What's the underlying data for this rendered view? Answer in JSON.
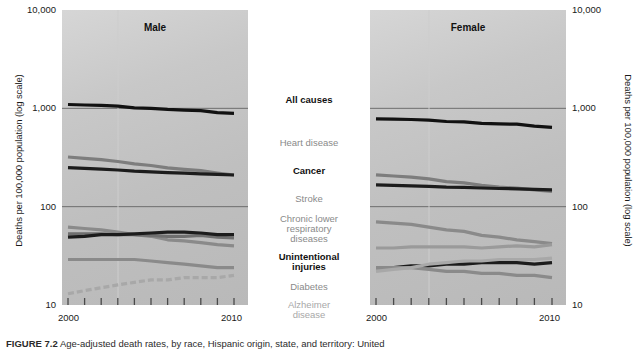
{
  "figure": {
    "caption_label": "FIGURE 7.2",
    "caption_text": "Age-adjusted death rates, by race, Hispanic origin, state, and territory: United"
  },
  "axes": {
    "y_title": "Deaths per 100,000 population (log scale)",
    "y_ticks": [
      "10,000",
      "1,000",
      "100",
      "10"
    ],
    "x_ticks": [
      "2000",
      "2010"
    ],
    "x_start_label": "2000",
    "x_end_label": "2010",
    "grid": "log",
    "ylim": [
      10,
      10000
    ]
  },
  "panels": [
    {
      "title": "Male"
    },
    {
      "title": "Female"
    }
  ],
  "legend": [
    {
      "label": "All causes",
      "style": "bold",
      "color": "#111111"
    },
    {
      "label": "Heart disease",
      "style": "gray",
      "color": "#8a8a8a"
    },
    {
      "label": "Cancer",
      "style": "bold",
      "color": "#111111"
    },
    {
      "label": "Stroke",
      "style": "gray",
      "color": "#8a8a8a"
    },
    {
      "label": "Chronic lower respiratory diseases",
      "style": "gray",
      "color": "#8a8a8a"
    },
    {
      "label": "Unintentional injuries",
      "style": "bold",
      "color": "#111111"
    },
    {
      "label": "Diabetes",
      "style": "gray",
      "color": "#8a8a8a"
    },
    {
      "label": "Alzheimer disease",
      "style": "light",
      "color": "#a8a8a8"
    }
  ],
  "chart_data": {
    "type": "line",
    "title": "Age-adjusted death rates, by race, Hispanic origin, state, and territory: United",
    "xlabel": "",
    "ylabel": "Deaths per 100,000 population (log scale)",
    "yscale": "log",
    "ylim": [
      10,
      10000
    ],
    "x": [
      2000,
      2001,
      2002,
      2003,
      2004,
      2005,
      2006,
      2007,
      2008,
      2009,
      2010
    ],
    "panels": [
      {
        "name": "Male",
        "series": [
          {
            "name": "All causes",
            "color": "#111111",
            "dash": false,
            "values": [
              1095,
              1080,
              1070,
              1050,
              1010,
              1000,
              975,
              960,
              945,
              905,
              890
            ]
          },
          {
            "name": "Heart disease",
            "color": "#7d7d7d",
            "dash": false,
            "values": [
              320,
              310,
              300,
              288,
              272,
              262,
              248,
              240,
              232,
              220,
              210
            ]
          },
          {
            "name": "Cancer",
            "color": "#1c1c1c",
            "dash": false,
            "values": [
              249,
              245,
              241,
              236,
              230,
              226,
              222,
              219,
              216,
              213,
              210
            ]
          },
          {
            "name": "Stroke",
            "color": "#8a8a8a",
            "dash": false,
            "values": [
              62,
              60,
              58,
              55,
              52,
              50,
              46,
              45,
              43,
              41,
              40
            ]
          },
          {
            "name": "Chronic lower respiratory diseases",
            "color": "#6f6f6f",
            "dash": false,
            "values": [
              53,
              53,
              53,
              52,
              52,
              51,
              50,
              50,
              51,
              49,
              48
            ]
          },
          {
            "name": "Unintentional injuries",
            "color": "#1c1c1c",
            "dash": false,
            "values": [
              49,
              50,
              52,
              52,
              53,
              54,
              55,
              55,
              54,
              52,
              52
            ]
          },
          {
            "name": "Diabetes",
            "color": "#8a8a8a",
            "dash": false,
            "values": [
              29,
              29,
              29,
              29,
              29,
              28,
              27,
              26,
              25,
              24,
              24
            ]
          },
          {
            "name": "Alzheimer disease",
            "color": "#a8a8a8",
            "dash": true,
            "values": [
              13,
              14,
              15,
              16,
              17,
              18,
              18,
              19,
              19,
              19,
              20
            ]
          }
        ]
      },
      {
        "name": "Female",
        "series": [
          {
            "name": "All causes",
            "color": "#111111",
            "dash": false,
            "values": [
              780,
              775,
              770,
              760,
              735,
              730,
              705,
              695,
              690,
              660,
              640
            ]
          },
          {
            "name": "Heart disease",
            "color": "#7d7d7d",
            "dash": false,
            "values": [
              211,
              205,
              200,
              192,
              180,
              175,
              165,
              158,
              154,
              148,
              143
            ]
          },
          {
            "name": "Cancer",
            "color": "#1c1c1c",
            "dash": false,
            "values": [
              167,
              165,
              163,
              161,
              158,
              157,
              155,
              153,
              152,
              150,
              148
            ]
          },
          {
            "name": "Stroke",
            "color": "#8a8a8a",
            "dash": false,
            "values": [
              70,
              68,
              66,
              62,
              58,
              56,
              51,
              49,
              46,
              44,
              42
            ]
          },
          {
            "name": "Chronic lower respiratory diseases",
            "color": "#9a9a9a",
            "dash": false,
            "values": [
              38,
              38,
              39,
              39,
              39,
              39,
              38,
              39,
              40,
              39,
              41
            ]
          },
          {
            "name": "Unintentional injuries",
            "color": "#1c1c1c",
            "dash": false,
            "values": [
              24,
              24,
              25,
              25,
              26,
              26,
              27,
              27,
              27,
              26,
              27
            ]
          },
          {
            "name": "Diabetes",
            "color": "#8a8a8a",
            "dash": false,
            "values": [
              24,
              24,
              24,
              23,
              22,
              22,
              21,
              21,
              20,
              20,
              19
            ]
          },
          {
            "name": "Alzheimer disease",
            "color": "#a8a8a8",
            "dash": false,
            "values": [
              22,
              23,
              24,
              26,
              27,
              28,
              28,
              29,
              29,
              29,
              30
            ]
          }
        ]
      }
    ]
  }
}
